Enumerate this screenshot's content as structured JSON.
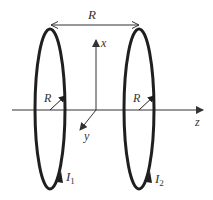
{
  "diagram": {
    "type": "helmholtz-coil-pair",
    "colors": {
      "coil": "#1f1f1f",
      "axis": "#333333",
      "text": "#333333",
      "background": "#ffffff"
    },
    "separation_label": "R",
    "axes": {
      "x_label": "x",
      "y_label": "y",
      "z_label": "z"
    },
    "coils": [
      {
        "name": "coil-1",
        "radius_label": "R",
        "current_label": "I",
        "current_subscript": "1"
      },
      {
        "name": "coil-2",
        "radius_label": "R",
        "current_label": "I",
        "current_subscript": "2"
      }
    ]
  }
}
